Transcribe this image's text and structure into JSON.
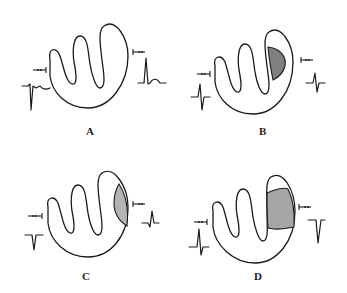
{
  "figure": {
    "colors": {
      "outline": "#1a1a1a",
      "background": "#ffffff",
      "lesion_B": "#808080",
      "lesion_C": "#b4b4b4",
      "lesion_D": "#a6a6a6"
    },
    "panels": [
      {
        "id": "A",
        "label": "A",
        "lesion": "none",
        "left_electrode_waveform": "qr-small-r-deep-q-with-T",
        "right_electrode_waveform": "tall-R-upright-T"
      },
      {
        "id": "B",
        "label": "B",
        "lesion": "subendocardial-dark-half-moon",
        "left_electrode_waveform": "rS-biphasic",
        "right_electrode_waveform": "small-RS-biphasic"
      },
      {
        "id": "C",
        "label": "C",
        "lesion": "subepicardial-light-lens",
        "left_electrode_waveform": "QS-negative",
        "right_electrode_waveform": "small-q-R-with-ST"
      },
      {
        "id": "D",
        "label": "D",
        "lesion": "transmural-band",
        "left_electrode_waveform": "qR-positive",
        "right_electrode_waveform": "QS-deep-negative"
      }
    ]
  }
}
